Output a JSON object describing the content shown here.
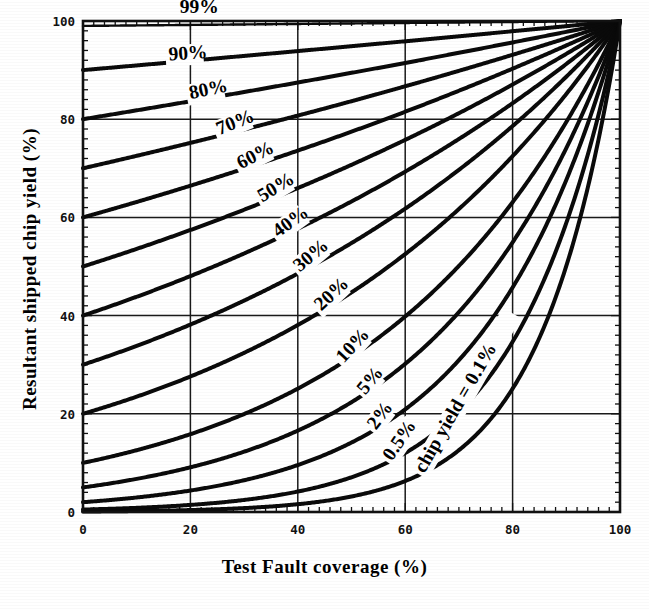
{
  "figure": {
    "xlabel": "Test Fault coverage (%)",
    "ylabel": "Resultant shipped chip yield (%)",
    "x_ticks": [
      "0",
      "20",
      "40",
      "60",
      "80",
      "100"
    ],
    "y_ticks": [
      "0",
      "20",
      "40",
      "60",
      "80",
      "100"
    ],
    "line_color": "#0a0a0a",
    "grid_color": "#1a1a1a",
    "background_color": "#ffffff"
  },
  "labels": {
    "c99": "99%",
    "c90": "90%",
    "c80": "80%",
    "c70": "70%",
    "c60": "60%",
    "c50": "50%",
    "c40": "40%",
    "c30": "30%",
    "c20": "20%",
    "c10": "10%",
    "c5": "5%",
    "c2": "2%",
    "c0_5": "0.5%",
    "c0_1": "chip yield = 0.1%"
  },
  "chart_data": {
    "type": "line",
    "title": "",
    "xlabel": "Test Fault coverage (%)",
    "ylabel": "Resultant shipped chip yield (%)",
    "xlim": [
      0,
      100
    ],
    "ylim": [
      0,
      100
    ],
    "xticks": [
      0,
      20,
      40,
      60,
      80,
      100
    ],
    "yticks": [
      0,
      20,
      40,
      60,
      80,
      100
    ],
    "grid": true,
    "legend": "inline-curve-labels",
    "formula": "shipped_yield = chip_yield ^ (1 - fault_coverage)",
    "x": [
      0,
      10,
      20,
      30,
      40,
      50,
      60,
      70,
      80,
      90,
      95,
      100
    ],
    "series": [
      {
        "name": "99%",
        "chip_yield": 99,
        "label": "99%",
        "values": [
          99.0,
          99.1,
          99.2,
          99.3,
          99.4,
          99.5,
          99.6,
          99.7,
          99.8,
          99.9,
          99.95,
          100.0
        ]
      },
      {
        "name": "90%",
        "chip_yield": 90,
        "label": "90%",
        "values": [
          90.0,
          90.9,
          91.8,
          92.7,
          93.7,
          94.6,
          95.6,
          96.6,
          97.7,
          98.8,
          99.4,
          100.0
        ]
      },
      {
        "name": "80%",
        "chip_yield": 80,
        "label": "80%",
        "values": [
          80.0,
          81.8,
          83.6,
          85.5,
          87.4,
          89.4,
          91.4,
          93.4,
          95.6,
          97.8,
          98.9,
          100.0
        ]
      },
      {
        "name": "70%",
        "chip_yield": 70,
        "label": "70%",
        "values": [
          70.0,
          72.5,
          75.2,
          77.9,
          80.7,
          83.7,
          86.7,
          89.8,
          93.1,
          96.5,
          98.2,
          100.0
        ]
      },
      {
        "name": "60%",
        "chip_yield": 60,
        "label": "60%",
        "values": [
          60.0,
          63.5,
          67.2,
          71.1,
          75.2,
          79.5,
          84.1,
          89.0,
          94.1,
          96.9,
          98.4,
          100.0
        ]
      },
      {
        "name": "50%",
        "chip_yield": 50,
        "label": "50%",
        "values": [
          50.0,
          54.0,
          58.2,
          62.8,
          67.7,
          73.0,
          78.7,
          84.9,
          91.6,
          95.7,
          97.8,
          100.0
        ]
      },
      {
        "name": "40%",
        "chip_yield": 40,
        "label": "40%",
        "values": [
          40.0,
          44.1,
          48.6,
          53.6,
          59.1,
          65.2,
          71.9,
          79.3,
          87.5,
          93.6,
          96.7,
          100.0
        ]
      },
      {
        "name": "30%",
        "chip_yield": 30,
        "label": "30%",
        "values": [
          30.0,
          33.9,
          38.3,
          43.3,
          48.9,
          55.2,
          62.4,
          70.5,
          79.7,
          90.0,
          94.9,
          100.0
        ]
      },
      {
        "name": "20%",
        "chip_yield": 20,
        "label": "20%",
        "values": [
          20.0,
          23.2,
          26.9,
          31.2,
          36.2,
          42.0,
          48.7,
          56.5,
          65.5,
          84.9,
          92.2,
          100.0
        ]
      },
      {
        "name": "10%",
        "chip_yield": 10,
        "label": "10%",
        "values": [
          10.0,
          12.6,
          15.8,
          19.9,
          25.1,
          31.6,
          39.8,
          50.1,
          63.1,
          79.4,
          89.1,
          100.0
        ]
      },
      {
        "name": "5%",
        "chip_yield": 5,
        "label": "5%",
        "values": [
          5.0,
          6.6,
          8.7,
          11.5,
          15.1,
          20.0,
          26.4,
          34.8,
          45.9,
          67.8,
          82.3,
          100.0
        ]
      },
      {
        "name": "2%",
        "chip_yield": 2,
        "label": "2%",
        "values": [
          2.0,
          2.8,
          3.9,
          5.5,
          7.7,
          10.8,
          15.2,
          21.2,
          29.8,
          54.1,
          73.6,
          100.0
        ]
      },
      {
        "name": "0.5%",
        "chip_yield": 0.5,
        "label": "0.5%",
        "values": [
          0.5,
          0.8,
          1.2,
          1.9,
          3.0,
          4.7,
          7.4,
          11.6,
          18.2,
          44.7,
          66.9,
          100.0
        ]
      },
      {
        "name": "0.1%",
        "chip_yield": 0.1,
        "label": "chip yield = 0.1%",
        "values": [
          0.1,
          0.2,
          0.3,
          0.5,
          1.0,
          1.8,
          3.3,
          6.3,
          11.9,
          39.8,
          63.1,
          100.0
        ]
      }
    ]
  }
}
